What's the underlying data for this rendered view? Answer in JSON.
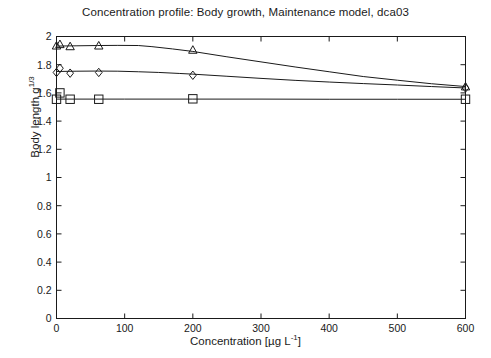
{
  "chart_data": {
    "type": "scatter",
    "title": "Concentration profile: Body growth, Maintenance model, dca03",
    "xlabel_text": "Concentration [µg L",
    "xlabel_sup": "-1",
    "xlabel_tail": "]",
    "ylabel_text": "Body length g",
    "ylabel_sup": "1/3",
    "xlim": [
      0,
      600
    ],
    "ylim": [
      0,
      2
    ],
    "xticks": [
      0,
      100,
      200,
      300,
      400,
      500,
      600
    ],
    "xtick_labels": [
      "0",
      "100",
      "200",
      "300",
      "400",
      "500",
      "600"
    ],
    "yticks": [
      0,
      0.2,
      0.4,
      0.6,
      0.8,
      1,
      1.2,
      1.4,
      1.6,
      1.8,
      2
    ],
    "ytick_labels": [
      "0",
      "0.2",
      "0.4",
      "0.6",
      "0.8",
      "1",
      "1.2",
      "1.4",
      "1.6",
      "1.8",
      "2"
    ],
    "grid": false,
    "legend": "none",
    "line_color": "#1a1a1a",
    "marker_color": "#1a1a1a",
    "background": "#ffffff",
    "series": [
      {
        "name": "triangle-series",
        "marker": "triangle",
        "x": [
          0,
          5,
          20,
          62,
          200,
          600
        ],
        "y": [
          1.935,
          1.945,
          1.93,
          1.935,
          1.905,
          1.645
        ],
        "curve_x": [
          0,
          30,
          60,
          90,
          120,
          140,
          170,
          200,
          250,
          300,
          350,
          400,
          450,
          500,
          550,
          600
        ],
        "curve_y": [
          1.932,
          1.934,
          1.936,
          1.937,
          1.936,
          1.928,
          1.912,
          1.894,
          1.856,
          1.82,
          1.784,
          1.75,
          1.716,
          1.69,
          1.665,
          1.645
        ]
      },
      {
        "name": "diamond-series",
        "marker": "diamond",
        "x": [
          0,
          5,
          20,
          62,
          200,
          600
        ],
        "y": [
          1.745,
          1.775,
          1.74,
          1.745,
          1.725,
          1.635
        ],
        "curve_x": [
          0,
          30,
          60,
          90,
          120,
          150,
          180,
          200,
          250,
          300,
          350,
          400,
          450,
          500,
          550,
          600
        ],
        "curve_y": [
          1.752,
          1.754,
          1.755,
          1.754,
          1.75,
          1.745,
          1.738,
          1.733,
          1.718,
          1.703,
          1.689,
          1.677,
          1.666,
          1.656,
          1.645,
          1.635
        ]
      },
      {
        "name": "square-series",
        "marker": "square",
        "x": [
          0,
          5,
          20,
          62,
          200,
          600
        ],
        "y": [
          1.555,
          1.6,
          1.555,
          1.555,
          1.558,
          1.555
        ],
        "curve_x": [
          0,
          100,
          200,
          300,
          400,
          500,
          600
        ],
        "curve_y": [
          1.556,
          1.556,
          1.556,
          1.556,
          1.555,
          1.555,
          1.555
        ]
      }
    ]
  }
}
